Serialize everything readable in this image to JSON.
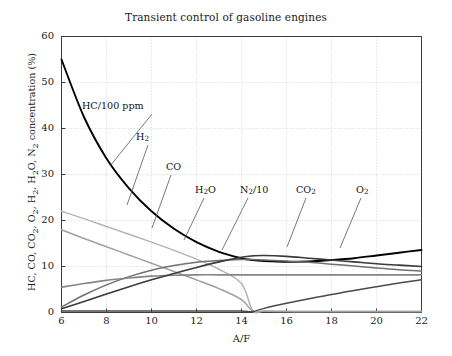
{
  "chart_data": {
    "type": "line",
    "title": "Transient control of gasoline engines",
    "xlabel": "A/F",
    "ylabel": "HC, CO, CO2, O2, H2, H2O, N2 concentration (%)",
    "xlim": [
      6,
      22
    ],
    "ylim": [
      0,
      60
    ],
    "xticks": [
      6,
      8,
      10,
      12,
      14,
      16,
      18,
      20,
      22
    ],
    "yticks": [
      0,
      10,
      20,
      30,
      40,
      50,
      60
    ],
    "grid": true,
    "legend_position": "inline-annotations",
    "x": [
      6,
      7,
      8,
      9,
      10,
      11,
      12,
      13,
      14,
      14.5,
      15,
      16,
      17,
      18,
      19,
      20,
      21,
      22
    ],
    "series": [
      {
        "name": "HC/100 ppm",
        "color": "#000000",
        "width": 1.9,
        "values": [
          55.0,
          42.5,
          33.5,
          27.0,
          22.0,
          18.2,
          15.3,
          13.2,
          11.8,
          11.4,
          11.2,
          11.0,
          11.1,
          11.4,
          11.8,
          12.4,
          13.0,
          13.6
        ]
      },
      {
        "name": "CO",
        "color": "#b4b4b4",
        "width": 1.5,
        "values": [
          22.0,
          20.4,
          18.7,
          17.0,
          15.3,
          13.5,
          11.6,
          9.4,
          6.3,
          0.4,
          0.3,
          0.25,
          0.2,
          0.2,
          0.2,
          0.2,
          0.2,
          0.2
        ]
      },
      {
        "name": "H2",
        "color": "#a0a0a0",
        "width": 1.5,
        "values": [
          18.0,
          16.1,
          14.3,
          12.5,
          10.7,
          8.9,
          7.1,
          5.2,
          2.8,
          0.3,
          0.25,
          0.2,
          0.2,
          0.2,
          0.2,
          0.2,
          0.2,
          0.2
        ]
      },
      {
        "name": "H2O",
        "color": "#707070",
        "width": 1.5,
        "values": [
          1.2,
          3.8,
          6.0,
          7.8,
          9.2,
          10.2,
          10.9,
          11.3,
          11.5,
          11.5,
          11.4,
          11.2,
          10.9,
          10.5,
          10.1,
          9.7,
          9.3,
          9.0
        ]
      },
      {
        "name": "N2/10",
        "color": "#858585",
        "width": 1.7,
        "values": [
          5.5,
          6.3,
          7.0,
          7.5,
          7.9,
          8.1,
          8.2,
          8.2,
          8.2,
          8.2,
          8.2,
          8.2,
          8.2,
          8.2,
          8.2,
          8.2,
          8.2,
          8.2
        ]
      },
      {
        "name": "CO2",
        "color": "#3a3a3a",
        "width": 1.6,
        "values": [
          0.8,
          2.4,
          4.0,
          5.6,
          7.1,
          8.5,
          9.8,
          11.0,
          12.0,
          12.3,
          12.4,
          12.2,
          11.8,
          11.4,
          11.0,
          10.6,
          10.3,
          10.0
        ]
      },
      {
        "name": "O2",
        "color": "#4a4a4a",
        "width": 1.5,
        "values": [
          0.3,
          0.3,
          0.3,
          0.3,
          0.3,
          0.3,
          0.3,
          0.3,
          0.3,
          0.2,
          0.9,
          2.0,
          3.0,
          3.9,
          4.8,
          5.6,
          6.4,
          7.1
        ]
      }
    ],
    "annotations": [
      {
        "text": "HC/100 ppm",
        "label_x": 82,
        "label_y": 100,
        "leader": [
          152,
          114,
          110,
          166
        ]
      },
      {
        "text": "H2",
        "label_x": 136,
        "label_y": 131,
        "leader": [
          148,
          145,
          127,
          205
        ]
      },
      {
        "text": "CO",
        "label_x": 166,
        "label_y": 161,
        "leader": [
          171,
          175,
          152,
          228
        ]
      },
      {
        "text": "H2O",
        "label_x": 195,
        "label_y": 184,
        "leader": [
          204,
          198,
          184,
          240
        ]
      },
      {
        "text": "N2/10",
        "label_x": 240,
        "label_y": 184,
        "leader": [
          248,
          198,
          222,
          250
        ]
      },
      {
        "text": "CO2",
        "label_x": 296,
        "label_y": 184,
        "leader": [
          306,
          198,
          287,
          247
        ]
      },
      {
        "text": "O2",
        "label_x": 356,
        "label_y": 184,
        "leader": [
          361,
          198,
          340,
          248
        ]
      }
    ]
  },
  "axis": {
    "ytick_labels": [
      "0",
      "10",
      "20",
      "30",
      "40",
      "50",
      "60"
    ],
    "xtick_labels": [
      "6",
      "8",
      "10",
      "12",
      "14",
      "16",
      "18",
      "20",
      "22"
    ]
  },
  "labels": {
    "hc": "HC/100 ppm",
    "h2": "H",
    "h2_sub": "2",
    "co": "CO",
    "h2o_a": "H",
    "h2o_sub": "2",
    "h2o_b": "O",
    "n2_a": "N",
    "n2_sub": "2",
    "n2_b": "/10",
    "co2_a": "CO",
    "co2_sub": "2",
    "o2_a": "O",
    "o2_sub": "2",
    "ylabel_p1": "HC, CO, CO",
    "ylabel_s1": "2",
    "ylabel_p2": ", O",
    "ylabel_s2": "2",
    "ylabel_p3": ", H",
    "ylabel_s3": "2",
    "ylabel_p4": ", H",
    "ylabel_s4": "2",
    "ylabel_p5": "O, N",
    "ylabel_s5": "2",
    "ylabel_p6": " concentration (%)"
  },
  "colors": {
    "axis": "#3c3c3c",
    "grid": "#dcdcdc",
    "text": "#1a1a1a",
    "background": "#ffffff"
  }
}
